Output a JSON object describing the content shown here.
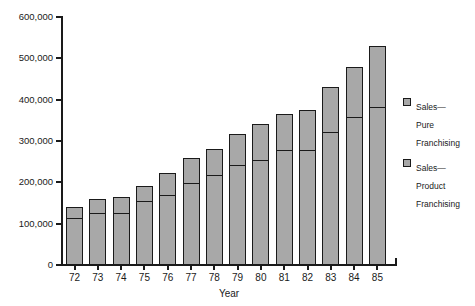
{
  "chart_data": {
    "type": "bar",
    "subtype": "stacked",
    "title": "",
    "xlabel": "Year",
    "ylabel": "",
    "categories": [
      "72",
      "73",
      "74",
      "75",
      "76",
      "77",
      "78",
      "79",
      "80",
      "81",
      "82",
      "83",
      "84",
      "85"
    ],
    "series": [
      {
        "name": "Sales—Product Franchising",
        "values": [
          112000,
          124000,
          124000,
          152000,
          168000,
          196000,
          216000,
          240000,
          252000,
          276000,
          276000,
          320000,
          356000,
          380000
        ]
      },
      {
        "name": "Sales—Pure Franchising",
        "values": [
          28000,
          36000,
          40000,
          38000,
          54000,
          64000,
          64000,
          78000,
          88000,
          90000,
          98000,
          110000,
          124000,
          150000
        ]
      }
    ],
    "totals": [
      140000,
      160000,
      164000,
      190000,
      222000,
      260000,
      280000,
      318000,
      340000,
      366000,
      374000,
      430000,
      480000,
      530000
    ],
    "ylim": [
      0,
      600000
    ],
    "ytick_values": [
      0,
      100000,
      200000,
      300000,
      400000,
      500000,
      600000
    ],
    "ytick_labels": [
      "0",
      "100,000",
      "200,000",
      "300,000",
      "400,000",
      "500,000",
      "600,000"
    ],
    "grid": false,
    "legend_position": "right",
    "colors": {
      "bar_fill": "#a8a8a8",
      "bar_border": "#1a1a1a",
      "axis": "#1a1a1a",
      "background": "#ffffff",
      "text": "#1a1a1a"
    }
  },
  "legend": {
    "items": [
      {
        "label_lines": [
          "Sales—",
          "Pure",
          "Franchising"
        ],
        "swatch": "legend-swatch-pure"
      },
      {
        "label_lines": [
          "Sales—",
          "Product",
          "Franchising"
        ],
        "swatch": "legend-swatch-product"
      }
    ]
  }
}
